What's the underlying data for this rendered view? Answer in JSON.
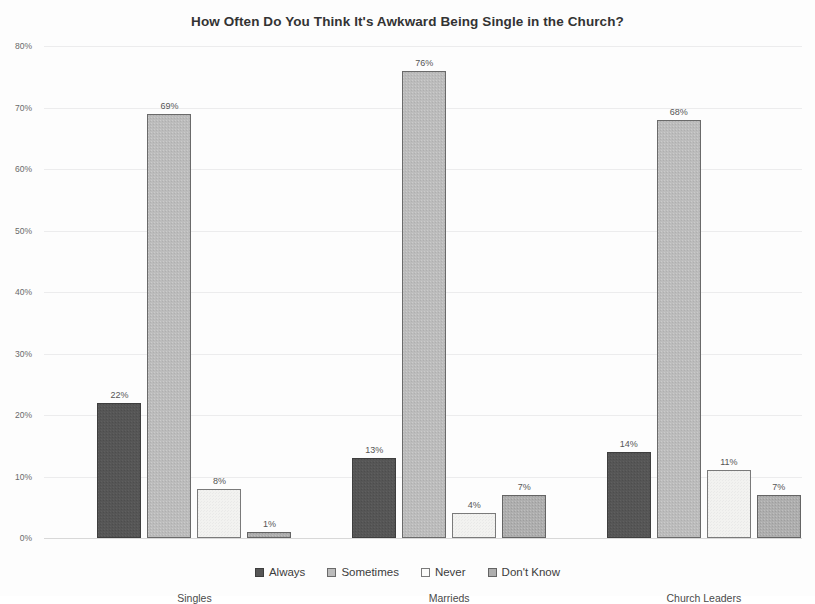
{
  "chart_data": {
    "type": "bar",
    "title": "How Often Do You Think It's Awkward Being Single in the Church?",
    "xlabel": "",
    "ylabel": "",
    "ylim": [
      0,
      80
    ],
    "ytick_labels": [
      "0%",
      "10%",
      "20%",
      "30%",
      "40%",
      "50%",
      "60%",
      "70%",
      "80%"
    ],
    "ytick_values": [
      0,
      10,
      20,
      30,
      40,
      50,
      60,
      70,
      80
    ],
    "grid": true,
    "legend_position": "bottom",
    "categories": [
      "Singles",
      "Marrieds",
      "Church Leaders"
    ],
    "series": [
      {
        "name": "Always",
        "key": "always",
        "color": "#565656",
        "values": [
          22,
          13,
          14
        ],
        "labels": [
          "22%",
          "13%",
          "14%"
        ]
      },
      {
        "name": "Sometimes",
        "key": "sometimes",
        "color": "#bcbcbc",
        "values": [
          69,
          76,
          68
        ],
        "labels": [
          "69%",
          "76%",
          "68%"
        ]
      },
      {
        "name": "Never",
        "key": "never",
        "color": "#f2f2f0",
        "values": [
          8,
          4,
          11
        ],
        "labels": [
          "8%",
          "4%",
          "11%"
        ]
      },
      {
        "name": "Don't Know",
        "key": "dontknow",
        "color": "#aeaeae",
        "values": [
          1,
          7,
          7
        ],
        "labels": [
          "1%",
          "7%",
          "7%"
        ]
      }
    ]
  }
}
